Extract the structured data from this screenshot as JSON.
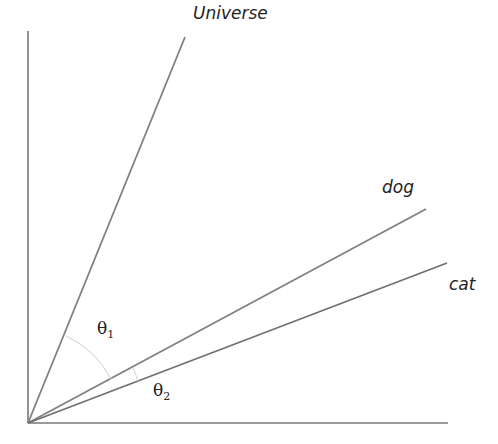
{
  "diagram": {
    "title": "",
    "vectors": [
      {
        "label": "Universe",
        "end": [
          185,
          37
        ]
      },
      {
        "label": "dog",
        "end": [
          426,
          210
        ]
      },
      {
        "label": "cat",
        "end": [
          447,
          263
        ]
      }
    ],
    "angles": [
      {
        "symbol": "θ",
        "subscript": "1"
      },
      {
        "symbol": "θ",
        "subscript": "2"
      }
    ],
    "colors": {
      "axis": "#7a7a7a",
      "vector": "#808080",
      "arc": "#cfcfcf",
      "text": "#222222"
    }
  }
}
